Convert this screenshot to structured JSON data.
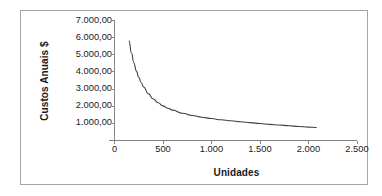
{
  "chart_data": {
    "type": "line",
    "title": "",
    "xlabel": "Unidades",
    "ylabel": "Custos Anuais $",
    "xlim": [
      0,
      2500
    ],
    "ylim": [
      0,
      7000
    ],
    "grid": false,
    "legend": "none",
    "x_tick_labels": [
      "0",
      "500",
      "1.000",
      "1.500",
      "2.000",
      "2.500"
    ],
    "x_tick_values": [
      0,
      500,
      1000,
      1500,
      2000,
      2500
    ],
    "y_tick_labels": [
      "-",
      "1.000,00",
      "2.000,00",
      "3.000,00",
      "4.000,00",
      "5.000,00",
      "6.000,00",
      "7.000,00"
    ],
    "y_tick_values": [
      0,
      1000,
      2000,
      3000,
      4000,
      5000,
      6000,
      7000
    ],
    "series": [
      {
        "name": "Custo Total Anual",
        "x": [
          150,
          175,
          200,
          225,
          250,
          275,
          300,
          350,
          400,
          450,
          500,
          550,
          600,
          700,
          800,
          900,
          1000,
          1100,
          1200,
          1300,
          1400,
          1500,
          1600,
          1700,
          1800,
          1900,
          2000,
          2080
        ],
        "y": [
          5800,
          5100,
          4520,
          4060,
          3690,
          3380,
          3120,
          2720,
          2420,
          2200,
          2020,
          1880,
          1770,
          1590,
          1460,
          1360,
          1280,
          1210,
          1150,
          1090,
          1040,
          990,
          940,
          900,
          860,
          820,
          780,
          760
        ]
      }
    ],
    "line_color": "#404040",
    "axis_color": "#868686",
    "text_color": "#1a1a1a",
    "border_color": "#a6a6a6",
    "background_color": "#ffffff"
  },
  "axes": {
    "y_title": "Custos Anuais $",
    "x_title": "Unidades"
  }
}
